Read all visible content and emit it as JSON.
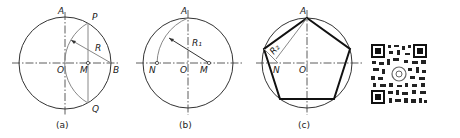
{
  "figure": {
    "panels": [
      {
        "id": "a",
        "caption": "(a)",
        "labels": {
          "A": "A",
          "P": "P",
          "R": "R",
          "O": "O",
          "M": "M",
          "B": "B",
          "Q": "Q"
        }
      },
      {
        "id": "b",
        "caption": "(b)",
        "labels": {
          "A": "A",
          "R1": "R₁",
          "N": "N",
          "O": "O",
          "M": "M"
        }
      },
      {
        "id": "c",
        "caption": "(c)",
        "labels": {
          "A": "A",
          "R2": "R₂",
          "N": "N",
          "O": "O"
        }
      }
    ]
  },
  "qr_code": {
    "label": "QR code"
  },
  "colors": {
    "line": "#333333",
    "construction": "#888888",
    "bold": "#111111",
    "background": "#ffffff"
  }
}
